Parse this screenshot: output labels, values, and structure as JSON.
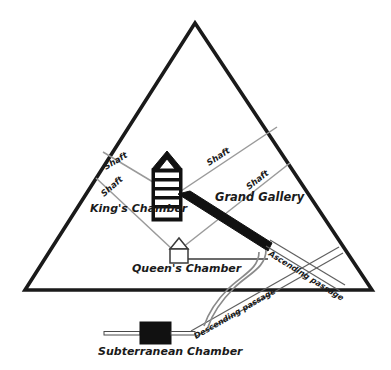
{
  "diagram": {
    "background_color": "#ffffff",
    "outline_color": "#1a1a1a",
    "solid_fill_color": "#111111",
    "shaft_color": "#9a9a9a",
    "passage_color": "#6e6e6e",
    "well_color": "#8a8a8a"
  },
  "labels": {
    "kings_chamber": "King's Chamber",
    "queens_chamber": "Queen's Chamber",
    "grand_gallery": "Grand Gallery",
    "subterranean_chamber": "Subterranean Chamber",
    "ascending_passage": "Ascending passage",
    "descending_passage": "Descending passage",
    "shaft_1": "Shaft",
    "shaft_2": "Shaft",
    "shaft_3": "Shaft",
    "shaft_4": "Shaft"
  }
}
